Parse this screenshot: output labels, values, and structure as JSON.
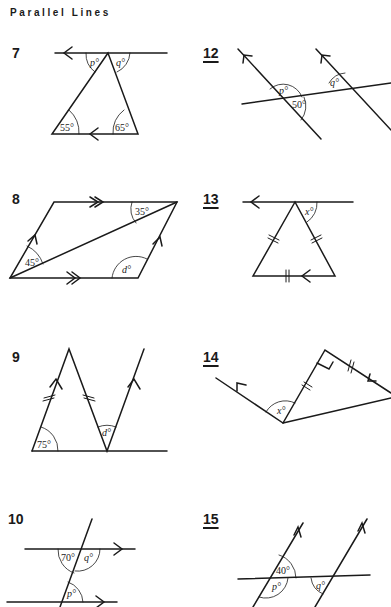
{
  "page": {
    "title": "Parallel Lines"
  },
  "questions": [
    {
      "number": "7",
      "labels": {
        "p": "p°",
        "q": "q°",
        "a": "55°",
        "b": "65°"
      }
    },
    {
      "number": "12",
      "labels": {
        "p": "p°",
        "q": "q°",
        "a": "50°"
      }
    },
    {
      "number": "8",
      "labels": {
        "a": "35°",
        "b": "45°",
        "d": "d°"
      }
    },
    {
      "number": "13",
      "labels": {
        "x": "x°"
      }
    },
    {
      "number": "9",
      "labels": {
        "a": "75°",
        "d": "d°"
      }
    },
    {
      "number": "14",
      "labels": {
        "x": "x°"
      }
    },
    {
      "number": "10",
      "labels": {
        "a": "70°",
        "q": "q°",
        "p": "p°"
      }
    },
    {
      "number": "15",
      "labels": {
        "a": "40°",
        "p": "p°",
        "q": "q°"
      }
    }
  ]
}
